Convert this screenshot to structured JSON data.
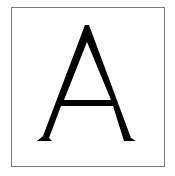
{
  "card": {
    "letter": "A",
    "border_color": "#7a7a7a",
    "glyph_color": "#000000",
    "background": "#ffffff"
  }
}
